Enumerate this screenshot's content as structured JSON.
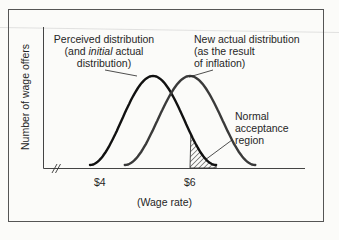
{
  "chart_data": {
    "type": "line",
    "title": "",
    "xlabel": "(Wage rate)",
    "ylabel": "Number of wage offers",
    "x_ticks": [
      {
        "label": "$4",
        "value": 4
      },
      {
        "label": "$6",
        "value": 6
      }
    ],
    "x_axis_break": true,
    "xlim": [
      2.8,
      9.0
    ],
    "series": [
      {
        "name": "Perceived distribution (and initial actual distribution)",
        "shape": "bell",
        "mean": 5.0,
        "support": [
          3.7,
          6.6
        ],
        "color": "#111111"
      },
      {
        "name": "New actual distribution (as the result of inflation)",
        "shape": "bell",
        "mean": 5.75,
        "support": [
          4.5,
          7.5
        ],
        "color": "#3a3a3a"
      }
    ],
    "shaded_region": {
      "name": "Normal acceptance region",
      "series": "Perceived distribution (and initial actual distribution)",
      "x_from": 6.0,
      "x_to": 6.6,
      "fill": "hatched"
    },
    "annotations": [
      {
        "id": "perceived",
        "lines": [
          "Perceived distribution",
          "(and ",
          "initial",
          " actual",
          "distribution)"
        ]
      },
      {
        "id": "new",
        "lines": [
          "New actual distribution",
          "(as the result",
          "of inflation)"
        ]
      },
      {
        "id": "accept",
        "lines": [
          "Normal",
          "acceptance",
          "region"
        ]
      }
    ],
    "grid": false
  },
  "labels": {
    "perceived_l1": "Perceived distribution",
    "perceived_l2a": "(and ",
    "perceived_l2b": "initial",
    "perceived_l2c": " actual",
    "perceived_l3": "distribution)",
    "new_l1": "New actual distribution",
    "new_l2": "(as the result",
    "new_l3": "of inflation)",
    "accept_l1": "Normal",
    "accept_l2": "acceptance",
    "accept_l3": "region",
    "tick_4": "$4",
    "tick_6": "$6",
    "xlabel": "(Wage rate)",
    "ylabel": "Number of wage offers"
  }
}
